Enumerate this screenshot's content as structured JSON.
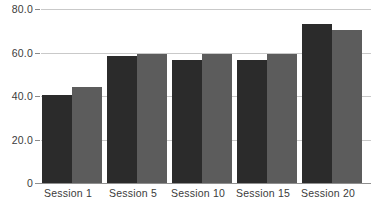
{
  "chart_data": {
    "type": "bar",
    "title": "",
    "xlabel": "",
    "ylabel": "",
    "categories": [
      "Session 1",
      "Session 5",
      "Session 10",
      "Session 15",
      "Session 20"
    ],
    "series": [
      {
        "name": "series-1",
        "color": "#2b2b2b",
        "values": [
          40.5,
          58.5,
          56.5,
          56.5,
          73.0
        ]
      },
      {
        "name": "series-2",
        "color": "#5c5c5c",
        "values": [
          44.0,
          59.5,
          59.5,
          59.5,
          70.5
        ]
      }
    ],
    "ylim": [
      0,
      80
    ],
    "y_ticks": [
      "0",
      "20.0",
      "40.0",
      "60.0",
      "80.0"
    ],
    "y_tick_values": [
      0,
      20,
      40,
      60,
      80
    ],
    "grid": true,
    "grid_color": "#c9c9c9",
    "legend": "none",
    "axis_color": "#8f8f8f",
    "background": "#ffffff"
  }
}
